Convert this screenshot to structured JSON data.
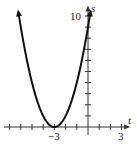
{
  "chart_data": {
    "type": "line",
    "title": "",
    "xlabel": "t",
    "ylabel": "s",
    "function": "s = (t + 3)^2",
    "x": [
      -6.2,
      -6,
      -5,
      -4,
      -3,
      -2,
      -1,
      0,
      0.2
    ],
    "series": [
      {
        "name": "s(t)",
        "values": [
          10.24,
          9,
          4,
          1,
          0,
          1,
          4,
          9,
          10.24
        ]
      }
    ],
    "xlim": [
      -7.5,
      3.5
    ],
    "ylim": [
      0,
      10.5
    ],
    "x_tick_labels": [
      {
        "value": -3,
        "label": "−3"
      },
      {
        "value": 3,
        "label": "3"
      }
    ],
    "y_tick_labels": [
      {
        "value": 10,
        "label": "10"
      }
    ],
    "x_ticks_step": 1,
    "y_ticks_step": 1,
    "grid": false,
    "legend": "none",
    "vertex": {
      "t": -3,
      "s": 0
    }
  },
  "labels": {
    "x_axis": "t",
    "y_axis": "s",
    "x_neg3": "−3",
    "x_3": "3",
    "y_10": "10"
  }
}
